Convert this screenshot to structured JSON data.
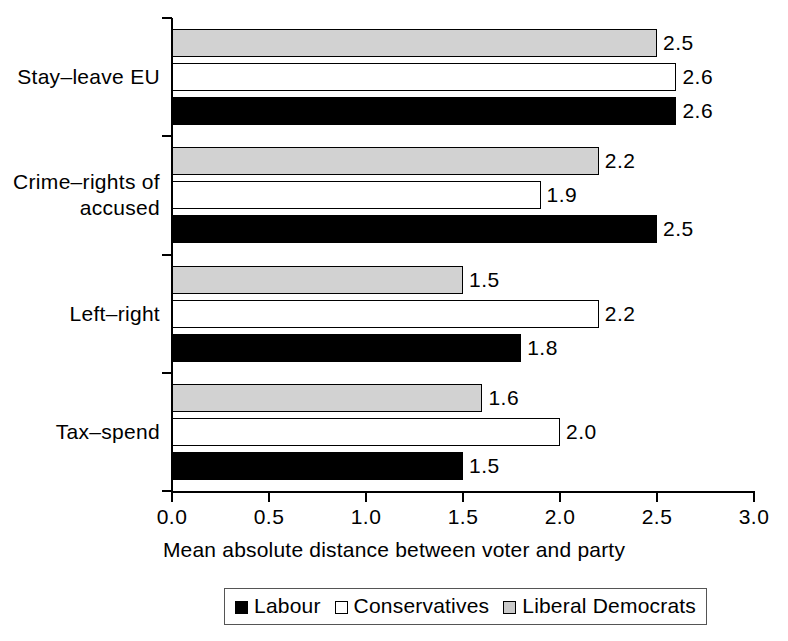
{
  "chart_data": {
    "type": "bar",
    "orientation": "horizontal",
    "title": "",
    "xlabel": "Mean absolute distance between voter and party",
    "ylabel": "",
    "xlim": [
      0.0,
      3.0
    ],
    "xticks": [
      "0.0",
      "0.5",
      "1.0",
      "1.5",
      "2.0",
      "2.5",
      "3.0"
    ],
    "xtick_values": [
      0.0,
      0.5,
      1.0,
      1.5,
      2.0,
      2.5,
      3.0
    ],
    "grid": false,
    "legend_position": "bottom",
    "categories": [
      "Stay–leave EU",
      "Crime–rights of accused",
      "Left–right",
      "Tax–spend"
    ],
    "category_lines": [
      [
        "Stay–leave EU"
      ],
      [
        "Crime–rights of",
        "accused"
      ],
      [
        "Left–right"
      ],
      [
        "Tax–spend"
      ]
    ],
    "series": [
      {
        "name": "Labour",
        "color": "#000000",
        "values": [
          2.6,
          2.5,
          1.8,
          1.5
        ],
        "labels": [
          "2.6",
          "2.5",
          "1.8",
          "1.5"
        ]
      },
      {
        "name": "Conservatives",
        "color": "#ffffff",
        "values": [
          2.6,
          1.9,
          2.2,
          2.0
        ],
        "labels": [
          "2.6",
          "1.9",
          "2.2",
          "2.0"
        ]
      },
      {
        "name": "Liberal Democrats",
        "color": "#d2d2d2",
        "values": [
          2.5,
          2.2,
          1.5,
          1.6
        ],
        "labels": [
          "2.5",
          "2.2",
          "1.5",
          "1.6"
        ]
      }
    ]
  },
  "legend": {
    "items": [
      {
        "label": "Labour",
        "swatch": "labour"
      },
      {
        "label": "Conservatives",
        "swatch": "conservatives"
      },
      {
        "label": "Liberal Democrats",
        "swatch": "libdems"
      }
    ]
  },
  "axis": {
    "x_title": "Mean absolute distance between voter and party"
  }
}
